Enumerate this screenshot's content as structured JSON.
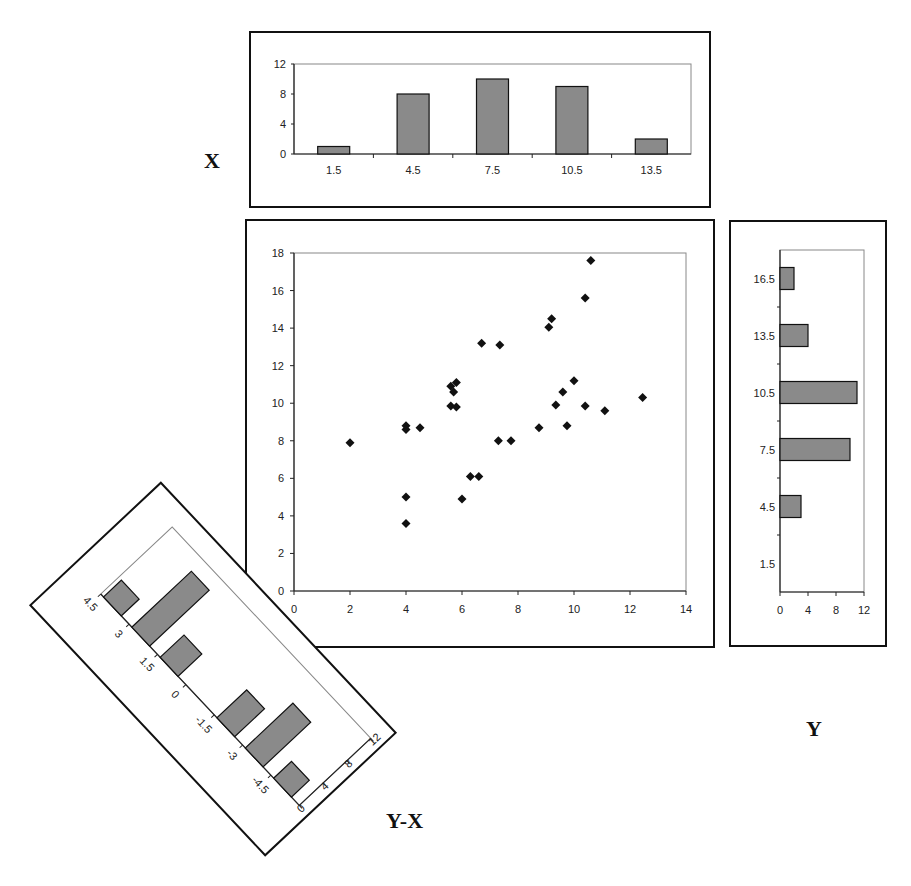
{
  "labels": {
    "x_panel": "X",
    "y_panel": "Y",
    "yx_panel": "Y-X"
  },
  "colors": {
    "bar_fill": "#8a8a8a",
    "bar_stroke": "#111111",
    "frame": "#111111",
    "marker": "#111111",
    "plot_border": "#888888"
  },
  "chart_data": [
    {
      "id": "x_histogram",
      "type": "bar",
      "title": "X",
      "orientation": "vertical",
      "categories": [
        "1.5",
        "4.5",
        "7.5",
        "10.5",
        "13.5"
      ],
      "values": [
        1,
        8,
        10,
        9,
        2
      ],
      "ylim": [
        0,
        12
      ],
      "yticks": [
        0,
        4,
        8,
        12
      ],
      "grid": false
    },
    {
      "id": "scatter_xy",
      "type": "scatter",
      "title": "",
      "xlabel": "X",
      "ylabel": "Y",
      "xlim": [
        0,
        14
      ],
      "ylim": [
        0,
        18
      ],
      "xticks": [
        0,
        2,
        4,
        6,
        8,
        10,
        12,
        14
      ],
      "yticks": [
        0,
        2,
        4,
        6,
        8,
        10,
        12,
        14,
        16,
        18
      ],
      "marker": "diamond",
      "grid": false,
      "points": [
        [
          2.0,
          7.9
        ],
        [
          4.0,
          8.8
        ],
        [
          4.0,
          8.6
        ],
        [
          4.5,
          8.7
        ],
        [
          4.0,
          5.0
        ],
        [
          4.0,
          3.6
        ],
        [
          6.0,
          4.9
        ],
        [
          6.3,
          6.1
        ],
        [
          6.6,
          6.1
        ],
        [
          5.6,
          9.85
        ],
        [
          5.8,
          9.8
        ],
        [
          5.6,
          10.9
        ],
        [
          5.8,
          11.1
        ],
        [
          5.7,
          10.6
        ],
        [
          6.7,
          13.2
        ],
        [
          7.35,
          13.1
        ],
        [
          7.3,
          8.0
        ],
        [
          7.75,
          8.0
        ],
        [
          8.75,
          8.7
        ],
        [
          9.75,
          8.8
        ],
        [
          9.35,
          9.9
        ],
        [
          9.6,
          10.6
        ],
        [
          10.0,
          11.2
        ],
        [
          10.4,
          9.85
        ],
        [
          11.1,
          9.6
        ],
        [
          12.45,
          10.3
        ],
        [
          9.1,
          14.05
        ],
        [
          9.2,
          14.5
        ],
        [
          10.4,
          15.6
        ],
        [
          10.6,
          17.6
        ]
      ]
    },
    {
      "id": "y_histogram",
      "type": "bar",
      "title": "Y",
      "orientation": "horizontal",
      "categories": [
        "16.5",
        "13.5",
        "10.5",
        "7.5",
        "4.5",
        "1.5"
      ],
      "values": [
        2,
        4,
        11,
        10,
        3,
        0
      ],
      "xlim": [
        0,
        12
      ],
      "xticks": [
        0,
        4,
        8,
        12
      ],
      "grid": false
    },
    {
      "id": "yx_histogram",
      "type": "bar",
      "title": "Y-X",
      "orientation": "horizontal (rotated ~47°)",
      "categories": [
        "4.5",
        "3",
        "1.5",
        "0",
        "-1.5",
        "-3",
        "-4.5"
      ],
      "bins": [
        "3.75",
        "2.25",
        "0.75",
        "-0.75",
        "-2.25",
        "-3.75"
      ],
      "bar_labels_note": "bars fall between tick categories",
      "values": [
        3,
        10,
        4,
        0,
        5,
        8,
        3
      ],
      "xlim": [
        0,
        12
      ],
      "xticks": [
        0,
        4,
        8,
        12
      ],
      "grid": false
    }
  ]
}
